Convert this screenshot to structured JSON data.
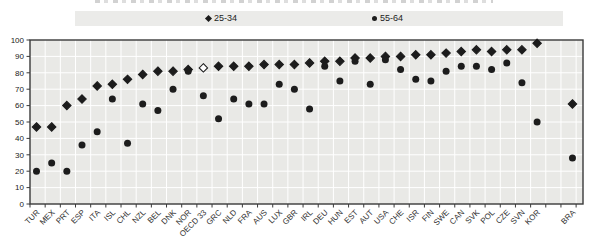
{
  "legend": {
    "items": [
      {
        "label": "25-34",
        "marker": "diamond"
      },
      {
        "label": "55-64",
        "marker": "circle"
      }
    ]
  },
  "colors": {
    "plot_bg": "#e9e9e6",
    "gridline": "#ffffff",
    "marker": "#1c1c1c",
    "axis": "#3a3a3a",
    "legend_bg": "#ebebe9"
  },
  "chart_data": {
    "type": "scatter",
    "title": "",
    "xlabel": "",
    "ylabel": "",
    "ylim": [
      0,
      100
    ],
    "y_ticks": [
      0,
      10,
      20,
      30,
      40,
      50,
      60,
      70,
      80,
      90,
      100
    ],
    "grid": "on",
    "legend_position": "top",
    "open_diamond_category": "OECD 33",
    "gap_before_category": "BRA",
    "gap_cols": 1.33,
    "series": [
      {
        "name": "25-34",
        "marker": "diamond"
      },
      {
        "name": "55-64",
        "marker": "circle"
      }
    ],
    "categories": [
      {
        "label": "TUR",
        "v25_34": 47,
        "v55_64": 20
      },
      {
        "label": "MEX",
        "v25_34": 47,
        "v55_64": 25
      },
      {
        "label": "PRT",
        "v25_34": 60,
        "v55_64": 20
      },
      {
        "label": "ESP",
        "v25_34": 64,
        "v55_64": 36
      },
      {
        "label": "ITA",
        "v25_34": 72,
        "v55_64": 44
      },
      {
        "label": "ISL",
        "v25_34": 73,
        "v55_64": 64
      },
      {
        "label": "CHL",
        "v25_34": 76,
        "v55_64": 37
      },
      {
        "label": "NZL",
        "v25_34": 79,
        "v55_64": 61
      },
      {
        "label": "BEL",
        "v25_34": 81,
        "v55_64": 57
      },
      {
        "label": "DNK",
        "v25_34": 81,
        "v55_64": 70
      },
      {
        "label": "NOR",
        "v25_34": 82,
        "v55_64": 81
      },
      {
        "label": "OECD 33",
        "v25_34": 83,
        "v55_64": 66
      },
      {
        "label": "GRC",
        "v25_34": 84,
        "v55_64": 52
      },
      {
        "label": "NLD",
        "v25_34": 84,
        "v55_64": 64
      },
      {
        "label": "FRA",
        "v25_34": 84,
        "v55_64": 61
      },
      {
        "label": "AUS",
        "v25_34": 85,
        "v55_64": 61
      },
      {
        "label": "LUX",
        "v25_34": 85,
        "v55_64": 73
      },
      {
        "label": "GBR",
        "v25_34": 85,
        "v55_64": 70
      },
      {
        "label": "IRL",
        "v25_34": 86,
        "v55_64": 58
      },
      {
        "label": "DEU",
        "v25_34": 87,
        "v55_64": 84
      },
      {
        "label": "HUN",
        "v25_34": 87,
        "v55_64": 75
      },
      {
        "label": "EST",
        "v25_34": 89,
        "v55_64": 87
      },
      {
        "label": "AUT",
        "v25_34": 89,
        "v55_64": 73
      },
      {
        "label": "USA",
        "v25_34": 90,
        "v55_64": 88
      },
      {
        "label": "CHE",
        "v25_34": 90,
        "v55_64": 82
      },
      {
        "label": "ISR",
        "v25_34": 91,
        "v55_64": 76
      },
      {
        "label": "FIN",
        "v25_34": 91,
        "v55_64": 75
      },
      {
        "label": "SWE",
        "v25_34": 92,
        "v55_64": 81
      },
      {
        "label": "CAN",
        "v25_34": 93,
        "v55_64": 84
      },
      {
        "label": "SVK",
        "v25_34": 94,
        "v55_64": 84
      },
      {
        "label": "POL",
        "v25_34": 93,
        "v55_64": 82
      },
      {
        "label": "CZE",
        "v25_34": 94,
        "v55_64": 86
      },
      {
        "label": "SVN",
        "v25_34": 94,
        "v55_64": 74
      },
      {
        "label": "KOR",
        "v25_34": 98,
        "v55_64": 50
      },
      {
        "label": "BRA",
        "v25_34": 61,
        "v55_64": 28
      }
    ]
  }
}
